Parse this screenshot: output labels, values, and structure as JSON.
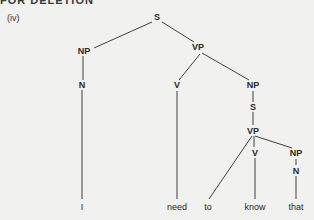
{
  "header": {
    "title": "FOR DELETION"
  },
  "figure_label": "(iv)",
  "tree": {
    "nodes": {
      "s_root": "S",
      "np_subj": "NP",
      "n_subj": "N",
      "vp_main": "VP",
      "v_main": "V",
      "np_obj": "NP",
      "s_embedded": "S",
      "vp_embedded": "VP",
      "v_embedded": "V",
      "np_embedded": "NP",
      "n_embedded": "N"
    },
    "leaves": [
      "I",
      "need",
      "to",
      "know",
      "that"
    ]
  },
  "colors": {
    "background": "#f1f1ef",
    "ink": "#2a2a2a"
  }
}
